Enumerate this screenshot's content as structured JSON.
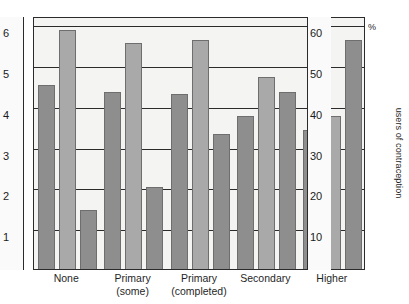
{
  "chart_data": {
    "type": "bar",
    "title": "",
    "subtitle": "",
    "xlabel": "",
    "ylabel": "number of children",
    "y2label": "users of contraception",
    "y2unit": "%",
    "grid": true,
    "legend_position": "none",
    "categories": [
      "None",
      "Primary (some)",
      "Primary (completed)",
      "Secondary",
      "Higher"
    ],
    "category_lines": [
      [
        "None",
        ""
      ],
      [
        "Primary",
        "(some)"
      ],
      [
        "Primary",
        "(completed)"
      ],
      [
        "Secondary",
        ""
      ],
      [
        "Higher",
        ""
      ]
    ],
    "ylim": [
      0,
      6.2
    ],
    "yticks": [
      1,
      2,
      3,
      4,
      5,
      6
    ],
    "ytick_labels": [
      "1",
      "2",
      "3",
      "4",
      "5",
      "6"
    ],
    "y2lim": [
      0,
      62
    ],
    "y2ticks": [
      10,
      20,
      30,
      40,
      50,
      60
    ],
    "y2tick_labels": [
      "10",
      "20",
      "30",
      "40",
      "50",
      "60"
    ],
    "series": [
      {
        "name": "bar-1",
        "color": "#8e8e8e",
        "values": [
          4.5,
          4.35,
          4.3,
          3.75,
          3.4
        ]
      },
      {
        "name": "bar-2",
        "color": "#a9a9a9",
        "values": [
          5.85,
          5.55,
          5.6,
          4.7,
          3.75
        ]
      },
      {
        "name": "bar-3",
        "color": "#8e8e8e",
        "values": [
          1.45,
          2.0,
          3.3,
          4.35,
          5.6
        ]
      }
    ],
    "bar_colors": [
      "#8e8e8e",
      "#a9a9a9",
      "#8e8e8e"
    ],
    "axis_color": "#2b2b2b",
    "plot_background": "#f4f4f2"
  },
  "axes": {
    "left_title": "number of children",
    "right_title": "users of contraception",
    "percent_symbol": "%"
  }
}
